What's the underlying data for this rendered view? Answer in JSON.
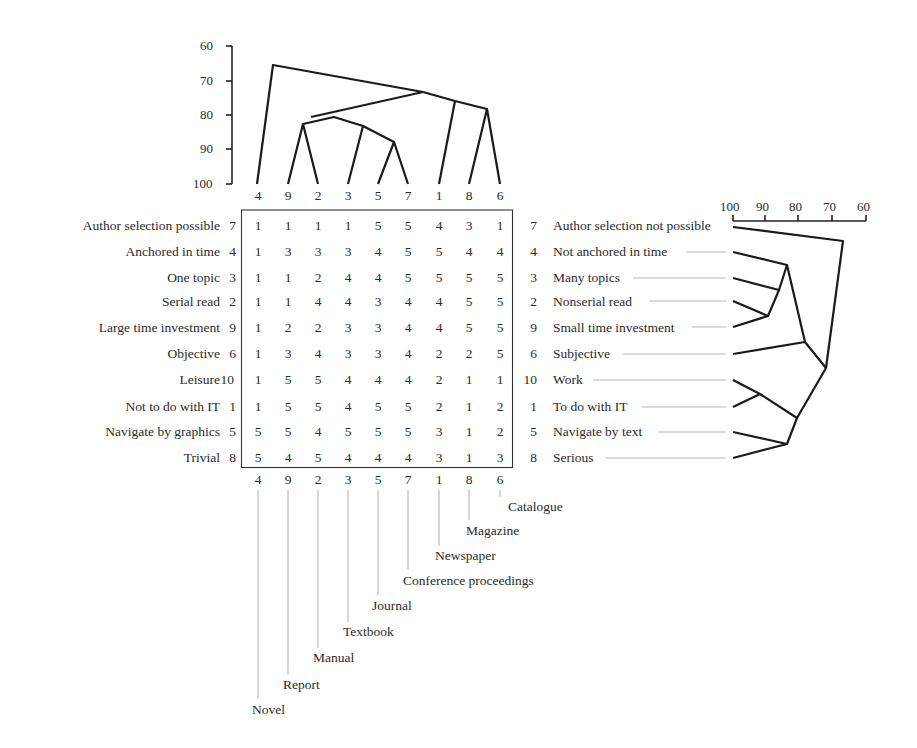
{
  "figure": {
    "type": "repertory_grid_focus",
    "element_order": [
      "4",
      "9",
      "2",
      "3",
      "5",
      "7",
      "1",
      "8",
      "6"
    ],
    "elements": [
      {
        "id": "4",
        "name": "Novel"
      },
      {
        "id": "9",
        "name": "Report"
      },
      {
        "id": "2",
        "name": "Manual"
      },
      {
        "id": "3",
        "name": "Textbook"
      },
      {
        "id": "5",
        "name": "Journal"
      },
      {
        "id": "7",
        "name": "Conference proceedings"
      },
      {
        "id": "1",
        "name": "Newspaper"
      },
      {
        "id": "8",
        "name": "Magazine"
      },
      {
        "id": "6",
        "name": "Catalogue"
      }
    ],
    "constructs": [
      {
        "id": "7",
        "left": "Author selection possible",
        "right": "Author selection not possible",
        "ratings": [
          "1",
          "1",
          "1",
          "1",
          "5",
          "5",
          "4",
          "3",
          "1"
        ]
      },
      {
        "id": "4",
        "left": "Anchored in time",
        "right": "Not anchored in time",
        "ratings": [
          "1",
          "3",
          "3",
          "3",
          "4",
          "5",
          "5",
          "4",
          "4"
        ]
      },
      {
        "id": "3",
        "left": "One topic",
        "right": "Many topics",
        "ratings": [
          "1",
          "1",
          "2",
          "4",
          "4",
          "5",
          "5",
          "5",
          "5"
        ]
      },
      {
        "id": "2",
        "left": "Serial read",
        "right": "Nonserial read",
        "ratings": [
          "1",
          "1",
          "4",
          "4",
          "3",
          "4",
          "4",
          "5",
          "5"
        ]
      },
      {
        "id": "9",
        "left": "Large time investment",
        "right": "Small time investment",
        "ratings": [
          "1",
          "2",
          "2",
          "3",
          "3",
          "4",
          "4",
          "5",
          "5"
        ]
      },
      {
        "id": "6",
        "left": "Objective",
        "right": "Subjective",
        "ratings": [
          "1",
          "3",
          "4",
          "3",
          "3",
          "4",
          "2",
          "2",
          "5"
        ]
      },
      {
        "id": "10",
        "left": "Leisure",
        "right": "Work",
        "ratings": [
          "1",
          "5",
          "5",
          "4",
          "4",
          "4",
          "2",
          "1",
          "1"
        ]
      },
      {
        "id": "1",
        "left": "Not to do with IT",
        "right": "To do with IT",
        "ratings": [
          "1",
          "5",
          "5",
          "4",
          "5",
          "5",
          "2",
          "1",
          "2"
        ]
      },
      {
        "id": "5",
        "left": "Navigate by graphics",
        "right": "Navigate by text",
        "ratings": [
          "5",
          "5",
          "4",
          "5",
          "5",
          "5",
          "3",
          "1",
          "2"
        ]
      },
      {
        "id": "8",
        "left": "Trivial",
        "right": "Serious",
        "ratings": [
          "5",
          "4",
          "5",
          "4",
          "4",
          "4",
          "3",
          "1",
          "3"
        ]
      }
    ],
    "element_dendrogram": {
      "axis_ticks": [
        "60",
        "70",
        "80",
        "90",
        "100"
      ],
      "merges": [
        {
          "members": [
            "5",
            "7"
          ],
          "similarity": 88
        },
        {
          "members": [
            "9",
            "2"
          ],
          "similarity": 82.5
        },
        {
          "members": [
            "3",
            "(5,7)"
          ],
          "similarity": 83
        },
        {
          "members": [
            "(9,2)",
            "(3,5,7)"
          ],
          "similarity": 80.5
        },
        {
          "members": [
            "8",
            "6"
          ],
          "similarity": 78
        },
        {
          "members": [
            "1",
            "(8,6)"
          ],
          "similarity": 75.5
        },
        {
          "members": [
            "(9,2,3,5,7)",
            "(1,8,6)"
          ],
          "similarity": 73
        },
        {
          "members": [
            "4",
            "rest"
          ],
          "similarity": 65.5
        }
      ]
    },
    "construct_dendrogram": {
      "axis_ticks": [
        "100",
        "90",
        "80",
        "70",
        "60"
      ],
      "merges": [
        {
          "members": [
            "2",
            "9"
          ],
          "similarity": 90
        },
        {
          "members": [
            "3",
            "(2,9)"
          ],
          "similarity": 86.5
        },
        {
          "members": [
            "4",
            "(3,2,9)"
          ],
          "similarity": 84
        },
        {
          "members": [
            "10",
            "1"
          ],
          "similarity": 92
        },
        {
          "members": [
            "5",
            "8"
          ],
          "similarity": 84
        },
        {
          "members": [
            "(10,1)",
            "(5,8)"
          ],
          "similarity": 81
        },
        {
          "members": [
            "(4,3,2,9)",
            "6"
          ],
          "similarity": 78.5
        },
        {
          "members": [
            "(4,3,2,9,6)",
            "(10,1,5,8)"
          ],
          "similarity": 72
        },
        {
          "members": [
            "7",
            "rest"
          ],
          "similarity": 67
        }
      ]
    }
  }
}
